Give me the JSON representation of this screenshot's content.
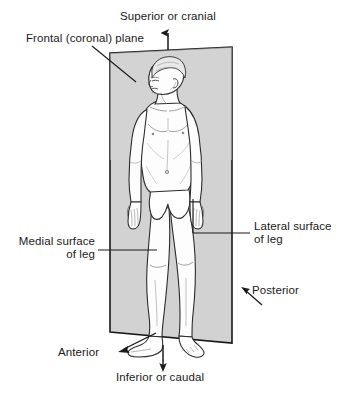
{
  "figure": {
    "plane_color": "#d2d2d2",
    "plane_edge_color": "#1a1a1a",
    "body_fill_color": "#fdfdfd",
    "body_outline_color": "#2b2b2b",
    "shade_color": "#c9c9c9",
    "text_color": "#1a1a1a",
    "background_color": "#ffffff"
  },
  "labels": {
    "superior": {
      "text": "Superior or cranial",
      "x": 120,
      "y": 10
    },
    "frontal_plane": {
      "text": "Frontal (coronal) plane",
      "x": 26,
      "y": 32
    },
    "lateral_surface_line1": {
      "text": "Lateral surface",
      "x": 254,
      "y": 220
    },
    "lateral_surface_line2": {
      "text": "of leg",
      "x": 254,
      "y": 233
    },
    "medial_surface_line1": {
      "text": "Medial surface",
      "x": 11,
      "y": 235
    },
    "medial_surface_line2": {
      "text": "of leg",
      "x": 11,
      "y": 248
    },
    "posterior": {
      "text": "Posterior",
      "x": 252,
      "y": 284
    },
    "anterior": {
      "text": "Anterior",
      "x": 58,
      "y": 346
    },
    "inferior": {
      "text": "Inferior or caudal",
      "x": 116,
      "y": 371
    }
  },
  "annotations": {
    "superior_arrow": "up-arrow",
    "inferior_arrow": "down-arrow",
    "anterior_arrow": "diagonal-arrow-lower-left",
    "posterior_arrow": "diagonal-arrow-lower-left",
    "frontal_plane_leader": "diagonal-leader-line",
    "medial_leader": "horizontal-leader-line",
    "lateral_leader": "horizontal-leader-line"
  }
}
